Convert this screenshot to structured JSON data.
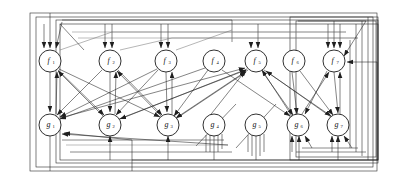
{
  "figure": {
    "background_color": "#ffffff",
    "line_color": "#1f1f1f",
    "faint_line_color": "#6d6d6d",
    "node_fill": "#ffffff",
    "node_stroke": "#1a1a1a",
    "node_radius": 11
  },
  "nodes": {
    "top_row": [
      {
        "id": "f1",
        "base": "f",
        "sub": "1",
        "cx": 50,
        "cy": 61
      },
      {
        "id": "f2",
        "base": "f",
        "sub": "2",
        "cx": 110,
        "cy": 61
      },
      {
        "id": "f3",
        "base": "f",
        "sub": "3",
        "cx": 166,
        "cy": 61
      },
      {
        "id": "f4",
        "base": "f",
        "sub": "4",
        "cx": 214,
        "cy": 61
      },
      {
        "id": "f5",
        "base": "f",
        "sub": "5",
        "cx": 256,
        "cy": 61
      },
      {
        "id": "f6",
        "base": "f",
        "sub": "6",
        "cx": 294,
        "cy": 61
      },
      {
        "id": "f7",
        "base": "f",
        "sub": "7",
        "cx": 334,
        "cy": 61
      }
    ],
    "bottom_row": [
      {
        "id": "g1",
        "base": "g",
        "sub": "1",
        "cx": 50,
        "cy": 125
      },
      {
        "id": "g2",
        "base": "g",
        "sub": "2",
        "cx": 110,
        "cy": 125
      },
      {
        "id": "g3",
        "base": "g",
        "sub": "3",
        "cx": 168,
        "cy": 125
      },
      {
        "id": "g4",
        "base": "g",
        "sub": "4",
        "cx": 214,
        "cy": 125
      },
      {
        "id": "g5",
        "base": "g",
        "sub": "5",
        "cx": 256,
        "cy": 125
      },
      {
        "id": "g6",
        "base": "g",
        "sub": "6",
        "cx": 298,
        "cy": 125
      },
      {
        "id": "g7",
        "base": "g",
        "sub": "7",
        "cx": 338,
        "cy": 125
      }
    ]
  },
  "chart_data": {
    "type": "diagram",
    "graph_kind": "directed bipartite recurrent network",
    "node_count": 14,
    "top_labels": [
      "f1",
      "f2",
      "f3",
      "f4",
      "f5",
      "f6",
      "f7"
    ],
    "bottom_labels": [
      "g1",
      "g2",
      "g3",
      "g4",
      "g5",
      "g6",
      "g7"
    ],
    "cross_edges": [
      [
        "f1",
        "g1"
      ],
      [
        "f1",
        "g2"
      ],
      [
        "f1",
        "g3"
      ],
      [
        "f2",
        "g1"
      ],
      [
        "f2",
        "g2"
      ],
      [
        "f2",
        "g3"
      ],
      [
        "f3",
        "g1"
      ],
      [
        "f3",
        "g2"
      ],
      [
        "f3",
        "g3"
      ],
      [
        "f4",
        "g1"
      ],
      [
        "f4",
        "g3"
      ],
      [
        "f4",
        "g6"
      ],
      [
        "f5",
        "g2"
      ],
      [
        "f5",
        "g3"
      ],
      [
        "f5",
        "g6"
      ],
      [
        "f5",
        "g7"
      ],
      [
        "f6",
        "g6"
      ],
      [
        "f6",
        "g7"
      ],
      [
        "f7",
        "g7"
      ],
      [
        "f7",
        "g6"
      ],
      [
        "g1",
        "f1"
      ],
      [
        "g1",
        "f5"
      ],
      [
        "g2",
        "f1"
      ],
      [
        "g2",
        "f2"
      ],
      [
        "g2",
        "f5"
      ],
      [
        "g3",
        "f2"
      ],
      [
        "g3",
        "f3"
      ],
      [
        "g3",
        "f5"
      ],
      [
        "g6",
        "f5"
      ],
      [
        "g6",
        "f7"
      ],
      [
        "g7",
        "f7"
      ],
      [
        "g7",
        "f5"
      ]
    ],
    "vertical_edges": [
      [
        "f1",
        "g1"
      ],
      [
        "f2",
        "g2"
      ],
      [
        "f3",
        "g3"
      ],
      [
        "f7",
        "g7"
      ]
    ],
    "feedback_frames": 6,
    "legend": []
  }
}
